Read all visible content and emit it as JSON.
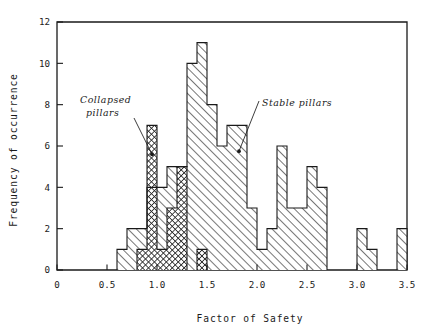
{
  "chart_data": {
    "type": "bar",
    "subtype": "overlaid-histogram",
    "title": "",
    "xlabel": "Factor of Safety",
    "ylabel": "Frequency of occurrence",
    "xlim": [
      0,
      3.5
    ],
    "ylim": [
      0,
      12
    ],
    "xticks": [
      "0",
      "0.5",
      "1.0",
      "1.5",
      "2.0",
      "2.5",
      "3.0",
      "3.5"
    ],
    "xtick_values": [
      0,
      0.5,
      1.0,
      1.5,
      2.0,
      2.5,
      3.0,
      3.5
    ],
    "yticks": [
      "0",
      "2",
      "4",
      "6",
      "8",
      "10",
      "12"
    ],
    "ytick_values": [
      0,
      2,
      4,
      6,
      8,
      10,
      12
    ],
    "grid": false,
    "legend_position": "inline-annotations",
    "bin_width": 0.1,
    "bin_edges": [
      0.6,
      0.7,
      0.8,
      0.9,
      1.0,
      1.1,
      1.2,
      1.3,
      1.4,
      1.5,
      1.6,
      1.7,
      1.8,
      1.9,
      2.0,
      2.1,
      2.2,
      2.3,
      2.4,
      2.5,
      2.6,
      2.7,
      2.8,
      2.9,
      3.0,
      3.1,
      3.2,
      3.3,
      3.4,
      3.5
    ],
    "series": [
      {
        "name": "Stable pillars",
        "fill": "diagonal-hatch-light",
        "color": "#6e6e6e",
        "bin_starts": [
          0.6,
          0.7,
          0.8,
          0.9,
          1.0,
          1.1,
          1.2,
          1.3,
          1.4,
          1.5,
          1.6,
          1.7,
          1.8,
          1.9,
          2.0,
          2.1,
          2.2,
          2.3,
          2.4,
          2.5,
          2.6,
          2.7,
          2.8,
          2.9,
          3.0,
          3.1,
          3.2,
          3.3,
          3.4
        ],
        "values": [
          1,
          2,
          2,
          4,
          4,
          5,
          5,
          10,
          11,
          8,
          6,
          7,
          7,
          3,
          1,
          2,
          6,
          3,
          3,
          5,
          4,
          0,
          0,
          0,
          2,
          1,
          0,
          0,
          2
        ]
      },
      {
        "name": "Collapsed pillars",
        "fill": "cross-hatch-dark",
        "color": "#3a3a3a",
        "bin_starts": [
          0.6,
          0.7,
          0.8,
          0.9,
          1.0,
          1.1,
          1.2,
          1.3,
          1.4,
          1.5,
          1.6,
          1.7,
          1.8,
          1.9,
          2.0,
          2.1,
          2.2,
          2.3,
          2.4,
          2.5,
          2.6,
          2.7,
          2.8,
          2.9,
          3.0,
          3.1,
          3.2,
          3.3,
          3.4
        ],
        "values": [
          0,
          0,
          1,
          7,
          1,
          3,
          5,
          0,
          1,
          0,
          0,
          0,
          0,
          0,
          0,
          0,
          0,
          0,
          0,
          0,
          0,
          0,
          0,
          0,
          0,
          0,
          0,
          0,
          0
        ]
      }
    ],
    "annotations": [
      {
        "name": "collapsed-pillars-annotation",
        "text_line1": "Collapsed",
        "text_line2": "pillars",
        "points_to": {
          "x": 0.95,
          "y": 5.6
        }
      },
      {
        "name": "stable-pillars-annotation",
        "text_line1": "Stable pillars",
        "text_line2": "",
        "points_to": {
          "x": 1.82,
          "y": 5.75
        }
      }
    ]
  },
  "colors": {
    "axis": "#1a1a1a",
    "background": "#ffffff",
    "stable_fill": "#6e6e6e",
    "collapsed_fill": "#3a3a3a"
  }
}
